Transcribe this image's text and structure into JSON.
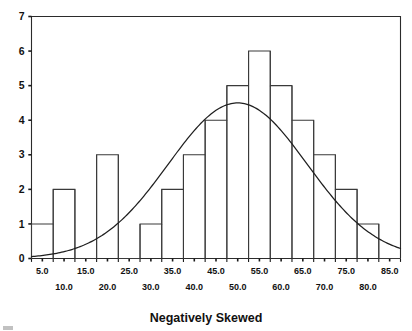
{
  "chart_data": {
    "type": "bar",
    "title": "",
    "subtitle": "",
    "xlabel": "Negatively Skewed",
    "ylabel": "",
    "categories": [
      "5.0",
      "10.0",
      "15.0",
      "20.0",
      "25.0",
      "30.0",
      "35.0",
      "40.0",
      "45.0",
      "50.0",
      "55.0",
      "60.0",
      "65.0",
      "70.0",
      "75.0",
      "80.0",
      "85.0"
    ],
    "values": [
      1,
      2,
      0,
      3,
      0,
      1,
      2,
      3,
      4,
      5,
      6,
      5,
      4,
      3,
      2,
      1,
      0
    ],
    "xlim": [
      2.5,
      87.5
    ],
    "ylim": [
      0,
      7
    ],
    "grid": false,
    "legend": null,
    "bin_width": 5,
    "x_tick_labels_upper": [
      "5.0",
      "15.0",
      "25.0",
      "35.0",
      "45.0",
      "55.0",
      "65.0",
      "75.0",
      "85.0"
    ],
    "x_tick_labels_lower": [
      "10.0",
      "20.0",
      "30.0",
      "40.0",
      "50.0",
      "60.0",
      "70.0",
      "80.0"
    ],
    "y_tick_labels": [
      "0",
      "1",
      "2",
      "3",
      "4",
      "5",
      "6",
      "7"
    ],
    "overlay_curve": {
      "name": "normal-distribution-curve",
      "type": "line",
      "peak_value": 4.5,
      "mean": 50.0,
      "std_dev": 16.0,
      "points_x": [
        2.5,
        5,
        10,
        15,
        20,
        25,
        30,
        35,
        40,
        45,
        50,
        55,
        60,
        65,
        70,
        75,
        80,
        85,
        87.5
      ],
      "points_y": [
        0.12,
        0.22,
        0.45,
        0.72,
        1.12,
        1.62,
        2.22,
        2.92,
        3.62,
        4.22,
        4.5,
        4.42,
        4.02,
        3.38,
        2.62,
        1.88,
        1.25,
        0.78,
        0.62
      ]
    }
  },
  "axis": {
    "x_title": "Negatively Skewed"
  }
}
